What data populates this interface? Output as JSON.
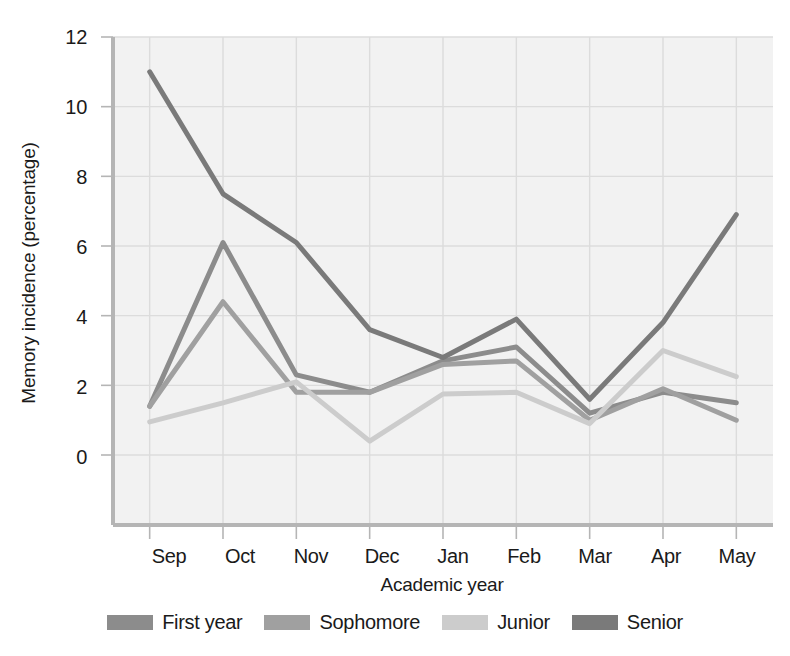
{
  "chart_data": {
    "type": "line",
    "title": "",
    "xlabel": "Academic year",
    "ylabel": "Memory incidence (percentage)",
    "categories": [
      "Sep",
      "Oct",
      "Nov",
      "Dec",
      "Jan",
      "Feb",
      "Mar",
      "Apr",
      "May"
    ],
    "ylim": [
      0,
      12
    ],
    "yticks": [
      0,
      2,
      4,
      6,
      8,
      10,
      12
    ],
    "grid": true,
    "legend_position": "bottom",
    "series": [
      {
        "name": "First year",
        "color": "#8c8c8c",
        "values": [
          1.4,
          6.1,
          2.3,
          1.8,
          2.7,
          3.1,
          1.2,
          1.8,
          1.5
        ]
      },
      {
        "name": "Sophomore",
        "color": "#a0a0a0",
        "values": [
          1.4,
          4.4,
          1.8,
          1.8,
          2.6,
          2.7,
          1.0,
          1.9,
          1.0
        ]
      },
      {
        "name": "Junior",
        "color": "#cccccc",
        "values": [
          0.95,
          1.5,
          2.1,
          0.4,
          1.75,
          1.8,
          0.9,
          3.0,
          2.25
        ]
      },
      {
        "name": "Senior",
        "color": "#7a7a7a",
        "values": [
          11.0,
          7.5,
          6.1,
          3.6,
          2.8,
          3.9,
          1.6,
          3.8,
          6.9
        ]
      }
    ]
  },
  "axis": {
    "y_title": "Memory incidence (percentage)",
    "x_title": "Academic year",
    "y_tick_labels": [
      "12",
      "10",
      "8",
      "6",
      "4",
      "2",
      "0"
    ],
    "x_tick_labels": [
      "Sep",
      "Oct",
      "Nov",
      "Dec",
      "Jan",
      "Feb",
      "Mar",
      "Apr",
      "May"
    ]
  },
  "legend": {
    "items": [
      {
        "label": "First year",
        "color": "#8c8c8c"
      },
      {
        "label": "Sophomore",
        "color": "#a0a0a0"
      },
      {
        "label": "Junior",
        "color": "#cccccc"
      },
      {
        "label": "Senior",
        "color": "#7a7a7a"
      }
    ]
  },
  "style": {
    "plot_background": "#f2f2f2",
    "grid_color": "#dcdcdc",
    "axis_color": "#b5b5b5",
    "text_color": "#1a1a1a"
  }
}
